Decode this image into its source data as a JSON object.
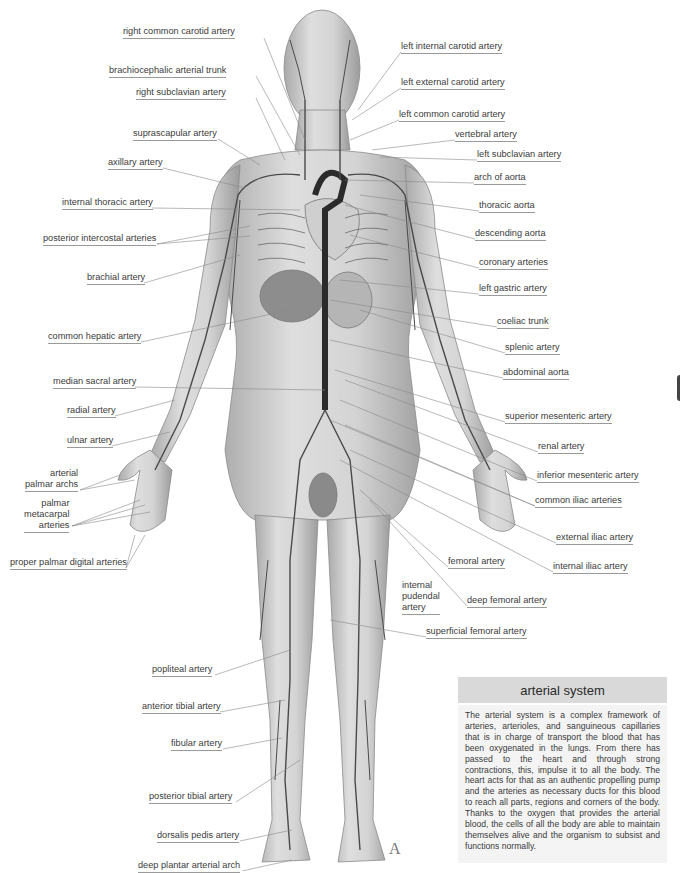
{
  "title": "arterial system",
  "description": "The arterial system is a complex framework of arteries, arterioles, and sanguineous capillaries that is in charge of transport the blood that has been oxygenated in the lungs. From there has passed to the heart and through strong contractions, this, impulse it to all the body. The heart acts for that as an authentic propelling pump and the arteries as necessary ducts for this blood to reach all parts, regions and corners of the body. Thanks to the oxygen that provides the arterial blood, the cells of all the body are able to maintain themselves alive and the organism to subsist and functions normally.",
  "plate_letter": "A",
  "colors": {
    "header_bg": "#d9d9d9",
    "body_bg": "#f4f4f4",
    "skin": "#c9c9c9",
    "artery": "#4a4a4a",
    "aorta": "#2b2b2b",
    "leader": "#8a8a8a"
  },
  "labels_left": [
    {
      "text": "right common carotid artery",
      "x": 123,
      "y": 26
    },
    {
      "text": "brachiocephalic arterial trunk",
      "x": 109,
      "y": 65
    },
    {
      "text": "right subclavian artery",
      "x": 136,
      "y": 87
    },
    {
      "text": "suprascapular artery",
      "x": 133,
      "y": 128
    },
    {
      "text": "axillary artery",
      "x": 108,
      "y": 157
    },
    {
      "text": "internal thoracic artery",
      "x": 62,
      "y": 197
    },
    {
      "text": "posterior intercostal arteries",
      "x": 43,
      "y": 233
    },
    {
      "text": "brachial artery",
      "x": 87,
      "y": 272
    },
    {
      "text": "common hepatic artery",
      "x": 48,
      "y": 331
    },
    {
      "text": "median sacral artery",
      "x": 53,
      "y": 376
    },
    {
      "text": "radial artery",
      "x": 67,
      "y": 405
    },
    {
      "text": "ulnar artery",
      "x": 67,
      "y": 435
    },
    {
      "text": "arterial palmar archs",
      "x": 25,
      "y": 468
    },
    {
      "text": "palmar metacarpal arteries",
      "x": 24,
      "y": 498
    },
    {
      "text": "proper palmar digital arteries",
      "x": 10,
      "y": 557
    },
    {
      "text": "popliteal artery",
      "x": 152,
      "y": 664
    },
    {
      "text": "anterior tibial artery",
      "x": 142,
      "y": 701
    },
    {
      "text": "fibular artery",
      "x": 171,
      "y": 738
    },
    {
      "text": "posterior tibial  artery",
      "x": 149,
      "y": 791
    },
    {
      "text": "dorsalis pedis artery",
      "x": 157,
      "y": 830
    },
    {
      "text": "deep plantar arterial arch",
      "x": 138,
      "y": 860
    }
  ],
  "labels_right": [
    {
      "text": "left internal carotid artery",
      "x": 401,
      "y": 41
    },
    {
      "text": "left external carotid artery",
      "x": 401,
      "y": 77
    },
    {
      "text": "left common carotid artery",
      "x": 399,
      "y": 109
    },
    {
      "text": "vertebral artery",
      "x": 455,
      "y": 129
    },
    {
      "text": "left subclavian artery",
      "x": 477,
      "y": 149
    },
    {
      "text": "arch of aorta",
      "x": 474,
      "y": 172
    },
    {
      "text": "thoracic aorta",
      "x": 479,
      "y": 200
    },
    {
      "text": "descending aorta",
      "x": 475,
      "y": 228
    },
    {
      "text": "coronary arteries",
      "x": 479,
      "y": 257
    },
    {
      "text": "left gastric artery",
      "x": 479,
      "y": 283
    },
    {
      "text": "coeliac trunk",
      "x": 497,
      "y": 316
    },
    {
      "text": "splenic artery",
      "x": 505,
      "y": 342
    },
    {
      "text": "abdominal aorta",
      "x": 503,
      "y": 367
    },
    {
      "text": "superior mesenteric artery",
      "x": 505,
      "y": 411
    },
    {
      "text": "renal artery",
      "x": 538,
      "y": 441
    },
    {
      "text": "inferior mesenteric artery",
      "x": 537,
      "y": 470
    },
    {
      "text": "common iliac arteries",
      "x": 535,
      "y": 495
    },
    {
      "text": "external iliac artery",
      "x": 556,
      "y": 532
    },
    {
      "text": "internal iliac artery",
      "x": 553,
      "y": 561
    },
    {
      "text": "femoral artery",
      "x": 448,
      "y": 556
    },
    {
      "text": "internal pudendal artery",
      "x": 402,
      "y": 580
    },
    {
      "text": "deep femoral artery",
      "x": 467,
      "y": 595
    },
    {
      "text": "superficial femoral artery",
      "x": 426,
      "y": 626
    }
  ]
}
